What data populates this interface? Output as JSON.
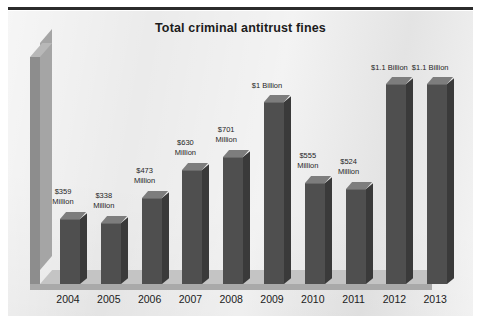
{
  "chart_data": {
    "type": "bar",
    "title": "Total criminal antitrust fines",
    "xlabel": "",
    "ylabel": "",
    "grid": false,
    "legend": null,
    "style": "3d-column",
    "unit": "USD",
    "categories": [
      "2004",
      "2005",
      "2006",
      "2007",
      "2008",
      "2009",
      "2010",
      "2011",
      "2012",
      "2013"
    ],
    "values": [
      359,
      338,
      473,
      630,
      701,
      1000,
      555,
      524,
      1100,
      1100
    ],
    "value_unit": "millions of dollars",
    "ylim": [
      0,
      1250
    ],
    "data_labels": [
      "$359\nMillion",
      "$338\nMillion",
      "$473\nMillion",
      "$630\nMillion",
      "$701\nMillion",
      "$1 Billion",
      "$555\nMillion",
      "$524\nMillion",
      "$1.1 Billion",
      "$1.1 Billion"
    ],
    "points": [
      {
        "year": "2004",
        "value": 359,
        "label_line1": "$359",
        "label_line2": "Million"
      },
      {
        "year": "2005",
        "value": 338,
        "label_line1": "$338",
        "label_line2": "Million"
      },
      {
        "year": "2006",
        "value": 473,
        "label_line1": "$473",
        "label_line2": "Million"
      },
      {
        "year": "2007",
        "value": 630,
        "label_line1": "$630",
        "label_line2": "Million"
      },
      {
        "year": "2008",
        "value": 701,
        "label_line1": "$701",
        "label_line2": "Million"
      },
      {
        "year": "2009",
        "value": 1000,
        "label_line1": "$1 Billion",
        "label_line2": ""
      },
      {
        "year": "2010",
        "value": 555,
        "label_line1": "$555",
        "label_line2": "Million"
      },
      {
        "year": "2011",
        "value": 524,
        "label_line1": "$524",
        "label_line2": "Million"
      },
      {
        "year": "2012",
        "value": 1100,
        "label_line1": "$1.1 Billion",
        "label_line2": ""
      },
      {
        "year": "2013",
        "value": 1100,
        "label_line1": "$1.1 Billion",
        "label_line2": ""
      }
    ]
  },
  "colors": {
    "plot_background": "#ebebeb",
    "bar_front": "#4f4f4f",
    "bar_side": "#3a3a3a",
    "bar_top": "#7d7d7d",
    "axis_wall": "#8d8d8d",
    "floor": "#c4c4c4",
    "title_text": "#1c1c1c",
    "label_text": "#1f1f1f",
    "top_rule": "#2b2b2b"
  }
}
